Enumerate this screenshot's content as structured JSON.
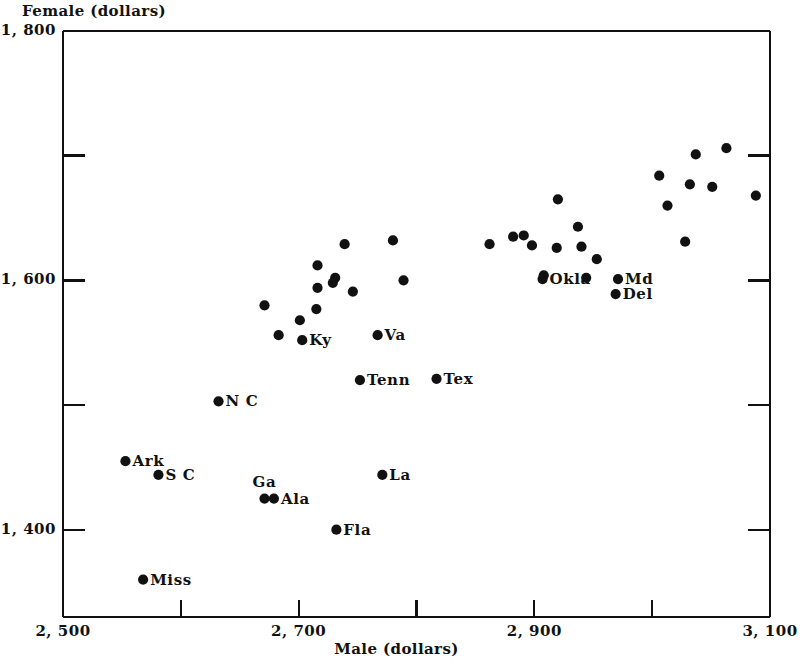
{
  "chart_data": {
    "type": "scatter",
    "title": "",
    "xlabel": "Male (dollars)",
    "ylabel": "Female (dollars)",
    "xlim": [
      2500,
      3100
    ],
    "ylim": [
      1330,
      1800
    ],
    "grid": false,
    "legend": null,
    "x_ticks": [
      {
        "value": 2500,
        "label": "2, 500",
        "major": true
      },
      {
        "value": 2600,
        "label": "",
        "major": false
      },
      {
        "value": 2700,
        "label": "2, 700",
        "major": true
      },
      {
        "value": 2800,
        "label": "",
        "major": false
      },
      {
        "value": 2900,
        "label": "2, 900",
        "major": true
      },
      {
        "value": 3000,
        "label": "",
        "major": false
      },
      {
        "value": 3100,
        "label": "3, 100",
        "major": true
      }
    ],
    "y_ticks": [
      {
        "value": 1800,
        "label": "1, 800",
        "major": true
      },
      {
        "value": 1700,
        "label": "",
        "major": false
      },
      {
        "value": 1600,
        "label": "1, 600",
        "major": true
      },
      {
        "value": 1500,
        "label": "",
        "major": false
      },
      {
        "value": 1400,
        "label": "1, 400",
        "major": true
      }
    ],
    "points": [
      {
        "x": 2553,
        "y": 1455,
        "label": "Ark",
        "label_pos": "right"
      },
      {
        "x": 2581,
        "y": 1444,
        "label": "S C",
        "label_pos": "right"
      },
      {
        "x": 2568,
        "y": 1360,
        "label": "Miss",
        "label_pos": "right"
      },
      {
        "x": 2632,
        "y": 1503,
        "label": "N C",
        "label_pos": "right"
      },
      {
        "x": 2671,
        "y": 1425,
        "label": "Ga",
        "label_pos": "above"
      },
      {
        "x": 2679,
        "y": 1425,
        "label": "Ala",
        "label_pos": "right"
      },
      {
        "x": 2771,
        "y": 1444,
        "label": "La",
        "label_pos": "right"
      },
      {
        "x": 2732,
        "y": 1400,
        "label": "Fla",
        "label_pos": "right"
      },
      {
        "x": 2703,
        "y": 1552,
        "label": "Ky",
        "label_pos": "right"
      },
      {
        "x": 2767,
        "y": 1556,
        "label": "Va",
        "label_pos": "right"
      },
      {
        "x": 2752,
        "y": 1520,
        "label": "Tenn",
        "label_pos": "right"
      },
      {
        "x": 2817,
        "y": 1521,
        "label": "Tex",
        "label_pos": "right"
      },
      {
        "x": 2907,
        "y": 1601,
        "label": "Okla",
        "label_pos": "right"
      },
      {
        "x": 2971,
        "y": 1601,
        "label": "Md",
        "label_pos": "right"
      },
      {
        "x": 2969,
        "y": 1589,
        "label": "Del",
        "label_pos": "right"
      },
      {
        "x": 2671,
        "y": 1580,
        "label": "",
        "label_pos": ""
      },
      {
        "x": 2716,
        "y": 1612,
        "label": "",
        "label_pos": ""
      },
      {
        "x": 2701,
        "y": 1568,
        "label": "",
        "label_pos": ""
      },
      {
        "x": 2716,
        "y": 1594,
        "label": "",
        "label_pos": ""
      },
      {
        "x": 2729,
        "y": 1598,
        "label": "",
        "label_pos": ""
      },
      {
        "x": 2731,
        "y": 1602,
        "label": "",
        "label_pos": ""
      },
      {
        "x": 2746,
        "y": 1591,
        "label": "",
        "label_pos": ""
      },
      {
        "x": 2715,
        "y": 1577,
        "label": "",
        "label_pos": ""
      },
      {
        "x": 2683,
        "y": 1556,
        "label": "",
        "label_pos": ""
      },
      {
        "x": 2739,
        "y": 1629,
        "label": "",
        "label_pos": ""
      },
      {
        "x": 2780,
        "y": 1632,
        "label": "",
        "label_pos": ""
      },
      {
        "x": 2789,
        "y": 1600,
        "label": "",
        "label_pos": ""
      },
      {
        "x": 2862,
        "y": 1629,
        "label": "",
        "label_pos": ""
      },
      {
        "x": 2882,
        "y": 1635,
        "label": "",
        "label_pos": ""
      },
      {
        "x": 2891,
        "y": 1636,
        "label": "",
        "label_pos": ""
      },
      {
        "x": 2920,
        "y": 1665,
        "label": "",
        "label_pos": ""
      },
      {
        "x": 2937,
        "y": 1643,
        "label": "",
        "label_pos": ""
      },
      {
        "x": 2898,
        "y": 1628,
        "label": "",
        "label_pos": ""
      },
      {
        "x": 2919,
        "y": 1626,
        "label": "",
        "label_pos": ""
      },
      {
        "x": 2940,
        "y": 1627,
        "label": "",
        "label_pos": ""
      },
      {
        "x": 2953,
        "y": 1617,
        "label": "",
        "label_pos": ""
      },
      {
        "x": 2908,
        "y": 1604,
        "label": "",
        "label_pos": ""
      },
      {
        "x": 2944,
        "y": 1602,
        "label": "",
        "label_pos": ""
      },
      {
        "x": 3006,
        "y": 1684,
        "label": "",
        "label_pos": ""
      },
      {
        "x": 3037,
        "y": 1701,
        "label": "",
        "label_pos": ""
      },
      {
        "x": 3063,
        "y": 1706,
        "label": "",
        "label_pos": ""
      },
      {
        "x": 3032,
        "y": 1677,
        "label": "",
        "label_pos": ""
      },
      {
        "x": 3051,
        "y": 1675,
        "label": "",
        "label_pos": ""
      },
      {
        "x": 3013,
        "y": 1660,
        "label": "",
        "label_pos": ""
      },
      {
        "x": 3028,
        "y": 1631,
        "label": "",
        "label_pos": ""
      },
      {
        "x": 3088,
        "y": 1668,
        "label": "",
        "label_pos": ""
      }
    ],
    "marker": {
      "shape": "circle",
      "color": "#111111",
      "size_px": 9
    }
  }
}
